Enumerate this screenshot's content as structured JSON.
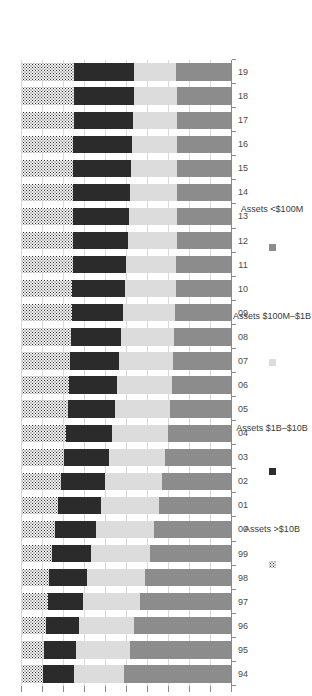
{
  "chart_data": {
    "type": "bar",
    "subtype": "100% stacked horizontal bar",
    "title": "",
    "xlabel": "",
    "ylabel": "",
    "ylim": [
      0,
      100
    ],
    "grid": true,
    "legend_position": "bottom",
    "orientation": "rotated-90ccw",
    "categories": [
      "94",
      "95",
      "96",
      "97",
      "98",
      "99",
      "00",
      "01",
      "02",
      "03",
      "04",
      "05",
      "06",
      "07",
      "08",
      "09",
      "10",
      "11",
      "12",
      "13",
      "14",
      "15",
      "16",
      "17",
      "18",
      "19"
    ],
    "tick_labels": [
      "100.0%",
      "90.0%",
      "80.0%",
      "70.0%",
      "60.0%",
      "50.0%",
      "40.0%",
      "30.0%",
      "20.0%",
      "10.0%",
      "0.0%"
    ],
    "tick_values": [
      100,
      90,
      80,
      70,
      60,
      50,
      40,
      30,
      20,
      10,
      0
    ],
    "series": [
      {
        "name": "Assets <$100M",
        "color": "#8c8c8c",
        "values": [
          51.5,
          48.8,
          46.5,
          44.0,
          41.5,
          39.2,
          37.0,
          35.0,
          33.2,
          31.8,
          30.5,
          29.5,
          28.8,
          28.2,
          27.5,
          27.0,
          26.8,
          26.5,
          26.2,
          26.0,
          26.0,
          26.0,
          26.0,
          26.2,
          26.2,
          26.5
        ]
      },
      {
        "name": "Assets $100M–$1B",
        "color": "#dcdcdc",
        "values": [
          23.8,
          25.5,
          26.2,
          26.8,
          27.5,
          27.8,
          27.8,
          27.5,
          27.2,
          26.8,
          26.5,
          26.2,
          26.0,
          25.5,
          25.2,
          24.8,
          24.2,
          23.8,
          23.5,
          23.0,
          22.5,
          22.0,
          21.5,
          21.0,
          20.5,
          20.0
        ]
      },
      {
        "name": "Assets $1B–$10B",
        "color": "#2b2b2b",
        "values": [
          14.8,
          15.2,
          16.0,
          17.0,
          18.0,
          18.8,
          19.5,
          20.2,
          21.0,
          21.5,
          22.0,
          22.5,
          23.0,
          23.5,
          24.0,
          24.5,
          25.0,
          25.5,
          26.0,
          26.5,
          27.0,
          27.5,
          28.0,
          28.2,
          28.5,
          28.8
        ]
      },
      {
        "name": "Assets >$10B",
        "color": "#2f2f2f",
        "pattern": "dotted",
        "values": [
          9.9,
          10.5,
          11.3,
          12.2,
          13.0,
          14.2,
          15.7,
          17.3,
          18.6,
          19.9,
          21.0,
          21.8,
          22.2,
          22.8,
          23.3,
          23.7,
          24.0,
          24.2,
          24.3,
          24.5,
          24.5,
          24.5,
          24.5,
          24.6,
          24.8,
          24.7
        ]
      }
    ]
  },
  "axis": {
    "value_ticks": [
      "100.0%",
      "90.0%",
      "80.0%",
      "70.0%",
      "60.0%",
      "50.0%",
      "40.0%",
      "30.0%",
      "20.0%",
      "10.0%",
      "0.0%"
    ],
    "category_ticks": [
      "94",
      "95",
      "96",
      "97",
      "98",
      "99",
      "00",
      "01",
      "02",
      "03",
      "04",
      "05",
      "06",
      "07",
      "08",
      "09",
      "10",
      "11",
      "12",
      "13",
      "14",
      "15",
      "16",
      "17",
      "18",
      "19"
    ]
  },
  "legend": {
    "items": [
      {
        "label": "Assets >$10B",
        "swatch": "k3"
      },
      {
        "label": "Assets $1B–$10B",
        "swatch": "k2"
      },
      {
        "label": "Assets $100M–$1B",
        "swatch": "k1"
      },
      {
        "label": "Assets <$100M",
        "swatch": "k0"
      }
    ]
  },
  "colors": {
    "lt100m": "#8c8c8c",
    "m100m_1b": "#dcdcdc",
    "b1_10b": "#2b2b2b",
    "gt10b": "#2f2f2f",
    "grid": "#d9d9d9",
    "axis": "#8a8a8a",
    "text": "#3a3a3a",
    "background": "#ffffff"
  }
}
